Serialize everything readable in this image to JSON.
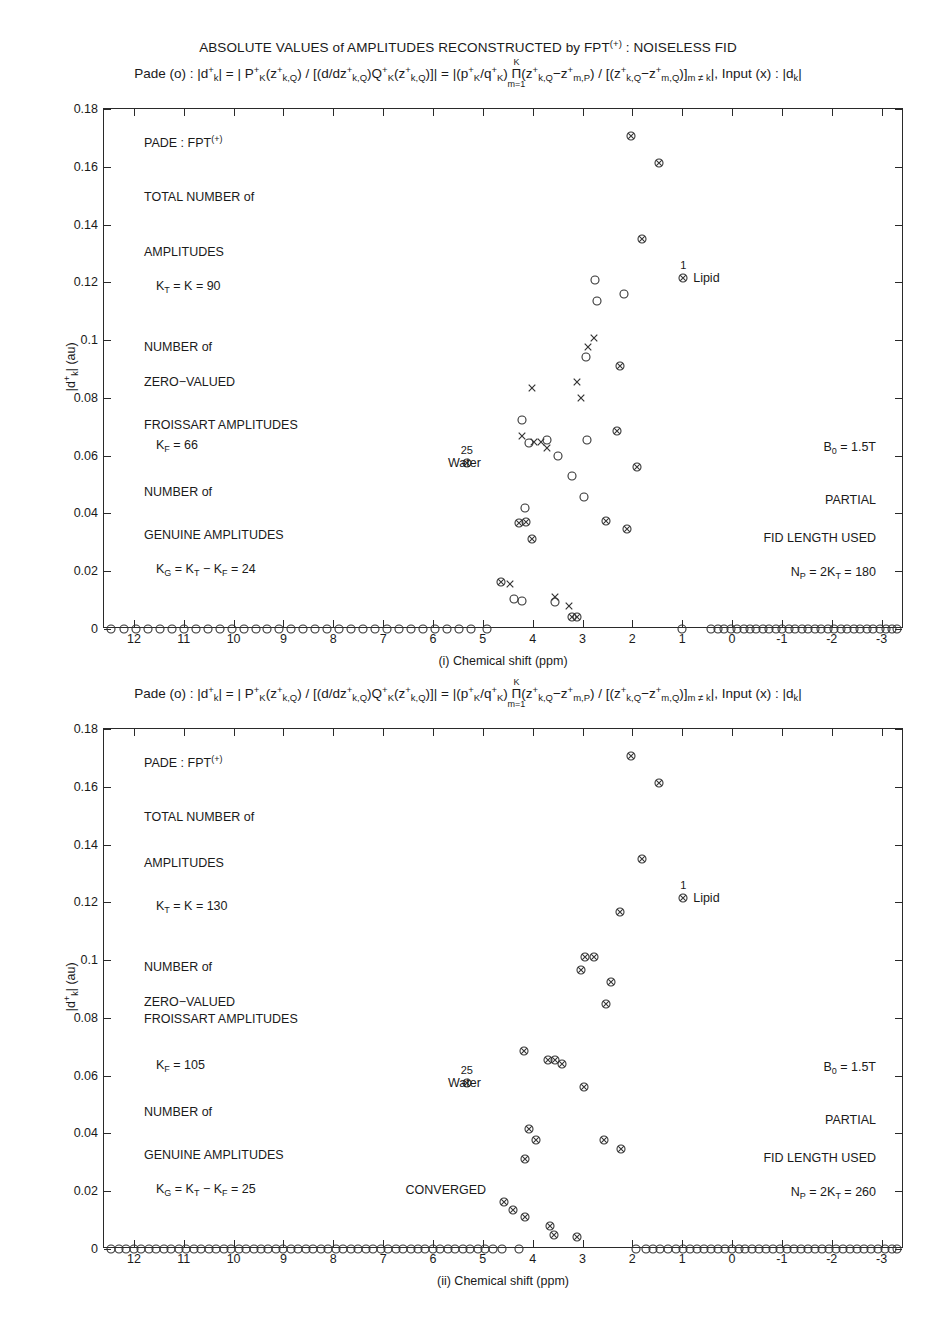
{
  "figure": {
    "suptitle_pre": "ABSOLUTE VALUES of AMPLITUDES RECONSTRUCTED by FPT",
    "suptitle_sup": "(+)",
    "suptitle_post": " :  NOISELESS FID",
    "width": 936,
    "height": 1331
  },
  "formula": {
    "pade_prefix": "Pade (o) : ",
    "lhs": "|d",
    "lhs_sub": "k",
    "lhs_sup": "+",
    "lhs_close": "| = | P",
    "p_sub": "K",
    "p_sup": "+",
    "z1": "(z",
    "z1_sup": "+",
    "z1_sub": "k,Q",
    "z1_close": ") / [(d/dz",
    "dz_sup": "+",
    "dz_sub": "k,Q",
    "q_open": ")Q",
    "q_sub": "K",
    "q_sup": "+",
    "q_z": "(z",
    "q_z_sup": "+",
    "q_z_sub": "k,Q",
    "q_close": ")]| = |(p",
    "p2_sub": "K",
    "p2_sup": "+",
    "slash_q": "/q",
    "q2_sub": "K",
    "q2_sup": "+",
    "paren": ") ",
    "pi_sym": "Π",
    "pi_top": "K",
    "pi_bot": "m=1",
    "prod1_open": "(z",
    "prod1_sup": "+",
    "prod1_sub": "k,Q",
    "minus": "−z",
    "prod2_sup": "+",
    "prod2_sub_a": "m,P",
    "prod2_sub_b": "m,Q",
    "mid": ") / [(z",
    "mid_sup": "+",
    "mid_sub": "k,Q",
    "tail_close": ")]",
    "tail_sub": "m ≠ k",
    "tail_abs": "|",
    "input_text": ",  Input (x) : |d",
    "input_sub": "k",
    "input_close": "|"
  },
  "axes": {
    "y_ticks": [
      "0.18",
      "0.16",
      "0.14",
      "0.12",
      "0.1",
      "0.08",
      "0.06",
      "0.04",
      "0.02",
      "0"
    ],
    "y_values": [
      0.18,
      0.16,
      0.14,
      0.12,
      0.1,
      0.08,
      0.06,
      0.04,
      0.02,
      0
    ],
    "y_min": 0,
    "y_max": 0.18,
    "y_title_a": "|d",
    "y_title_sub": "k",
    "y_title_sup": "+",
    "y_title_b": "| (au)",
    "x_ticks": [
      "12",
      "11",
      "10",
      "9",
      "8",
      "7",
      "6",
      "5",
      "4",
      "3",
      "2",
      "1",
      "0",
      "-1",
      "-2",
      "-3"
    ],
    "x_values": [
      12,
      11,
      10,
      9,
      8,
      7,
      6,
      5,
      4,
      3,
      2,
      1,
      0,
      -1,
      -2,
      -3
    ],
    "x_min": -3.45,
    "x_max": 12.6,
    "x_title_top": "(i) Chemical shift (ppm)",
    "x_title_bottom": "(ii) Chemical shift (ppm)"
  },
  "panel1": {
    "notes_left": [
      {
        "text": "PADE : FPT",
        "sup": "(+)",
        "y": 0.1685
      },
      {
        "text": "TOTAL NUMBER of",
        "y": 0.1495
      },
      {
        "text": "AMPLITUDES",
        "y": 0.1305
      },
      {
        "text": "K_T = K = 90",
        "y": 0.1185,
        "indent": true
      },
      {
        "text": "NUMBER of",
        "y": 0.0975
      },
      {
        "text": "ZERO−VALUED",
        "y": 0.0855
      },
      {
        "text": "FROISSART AMPLITUDES",
        "y": 0.0705
      },
      {
        "text": "K_F = 66",
        "y": 0.0635,
        "indent": true
      },
      {
        "text": "NUMBER of",
        "y": 0.0475
      },
      {
        "text": "GENUINE AMPLITUDES",
        "y": 0.0325
      },
      {
        "text": "K_G = K_T − K_F = 24",
        "y": 0.0205,
        "indent": true
      }
    ],
    "notes_right": [
      {
        "text": "B_0 = 1.5T",
        "y": 0.0625
      },
      {
        "text": "PARTIAL",
        "y": 0.0445
      },
      {
        "text": "FID LENGTH USED",
        "y": 0.0315
      },
      {
        "text": "N_P = 2K_T = 180",
        "y": 0.0195
      }
    ],
    "label_water": {
      "text": "Water",
      "x": 5.32,
      "y": 0.0575,
      "count": "25"
    },
    "label_lipid": {
      "text": "Lipid",
      "x": 0.98,
      "y": 0.1215,
      "count": "1"
    },
    "markers_circle": [
      {
        "x": 4.22,
        "y": 0.0725
      },
      {
        "x": 4.07,
        "y": 0.0645
      },
      {
        "x": 3.72,
        "y": 0.0655
      },
      {
        "x": 3.49,
        "y": 0.0598
      },
      {
        "x": 3.22,
        "y": 0.053
      },
      {
        "x": 2.93,
        "y": 0.094
      },
      {
        "x": 2.75,
        "y": 0.1207
      },
      {
        "x": 2.7,
        "y": 0.1137
      },
      {
        "x": 2.16,
        "y": 0.1158
      },
      {
        "x": 2.97,
        "y": 0.0458
      },
      {
        "x": 4.38,
        "y": 0.0103
      },
      {
        "x": 4.21,
        "y": 0.0098
      },
      {
        "x": 3.55,
        "y": 0.0093
      },
      {
        "x": 4.16,
        "y": 0.0418
      },
      {
        "x": 2.9,
        "y": 0.0655
      }
    ],
    "markers_x": [
      {
        "x": 4.21,
        "y": 0.0668
      },
      {
        "x": 3.98,
        "y": 0.0648
      },
      {
        "x": 3.84,
        "y": 0.0648
      },
      {
        "x": 3.71,
        "y": 0.0628
      },
      {
        "x": 3.04,
        "y": 0.08
      },
      {
        "x": 2.88,
        "y": 0.0975
      },
      {
        "x": 2.77,
        "y": 0.1008
      },
      {
        "x": 3.12,
        "y": 0.0855
      },
      {
        "x": 4.45,
        "y": 0.0155
      },
      {
        "x": 3.56,
        "y": 0.0112
      },
      {
        "x": 3.27,
        "y": 0.0078
      },
      {
        "x": 4.02,
        "y": 0.0835
      }
    ],
    "markers_both": [
      {
        "x": 2.02,
        "y": 0.1708
      },
      {
        "x": 1.46,
        "y": 0.1612
      },
      {
        "x": 1.8,
        "y": 0.135
      },
      {
        "x": 0.98,
        "y": 0.1215
      },
      {
        "x": 2.25,
        "y": 0.0912
      },
      {
        "x": 5.32,
        "y": 0.0575
      },
      {
        "x": 2.31,
        "y": 0.0685
      },
      {
        "x": 1.9,
        "y": 0.0562
      },
      {
        "x": 4.13,
        "y": 0.037
      },
      {
        "x": 4.02,
        "y": 0.0312
      },
      {
        "x": 2.52,
        "y": 0.0375
      },
      {
        "x": 2.1,
        "y": 0.0345
      },
      {
        "x": 4.63,
        "y": 0.0163
      },
      {
        "x": 3.22,
        "y": 0.0042
      },
      {
        "x": 4.27,
        "y": 0.0368
      }
    ],
    "zero_line_x_left": [
      12.45,
      12.2,
      11.96,
      11.72,
      11.48,
      11.24,
      11.0,
      10.76,
      10.52,
      10.28,
      10.04,
      9.8,
      9.56,
      9.32,
      9.08,
      8.84,
      8.6,
      8.36,
      8.12,
      7.88,
      7.64,
      7.4,
      7.16,
      6.92,
      6.68,
      6.44,
      6.2,
      5.96,
      5.72,
      5.48,
      5.24,
      4.92
    ],
    "zero_line_x_right": [
      1.0,
      0.42,
      0.16,
      -0.1,
      -0.36,
      -0.62,
      -0.88,
      -1.14,
      -1.4,
      -1.66,
      -1.92,
      -2.18,
      -2.44,
      -2.7,
      -2.96,
      -3.2,
      -0.23,
      -0.49,
      -0.75,
      -1.01,
      -1.27,
      -1.53,
      -1.79,
      -2.05,
      -2.31,
      -2.57,
      -2.83,
      -3.08,
      0.29,
      0.03,
      -3.3
    ],
    "zero_line_marker_mid": {
      "x": 3.12,
      "y": 0.0042
    }
  },
  "panel2": {
    "notes_left": [
      {
        "text": "PADE : FPT",
        "sup": "(+)",
        "y": 0.1685
      },
      {
        "text": "TOTAL NUMBER of",
        "y": 0.1495
      },
      {
        "text": "AMPLITUDES",
        "y": 0.1335
      },
      {
        "text": "K_T = K = 130",
        "y": 0.1185,
        "indent": true
      },
      {
        "text": "NUMBER of",
        "y": 0.0975
      },
      {
        "text": "ZERO−VALUED",
        "y": 0.0855
      },
      {
        "text": "FROISSART AMPLITUDES",
        "y": 0.0795
      },
      {
        "text": "K_F = 105",
        "y": 0.0635,
        "indent": true
      },
      {
        "text": "NUMBER of",
        "y": 0.0475
      },
      {
        "text": "GENUINE AMPLITUDES",
        "y": 0.0325
      },
      {
        "text": "K_G = K_T − K_F = 25",
        "y": 0.0205,
        "indent": true
      }
    ],
    "notes_right": [
      {
        "text": "B_0 = 1.5T",
        "y": 0.0625
      },
      {
        "text": "PARTIAL",
        "y": 0.0445
      },
      {
        "text": "FID LENGTH USED",
        "y": 0.0315
      },
      {
        "text": "N_P = 2K_T = 260",
        "y": 0.0195
      }
    ],
    "note_converged": {
      "text": "CONVERGED",
      "x": 6.55,
      "y": 0.0205
    },
    "label_water": {
      "text": "Water",
      "x": 5.32,
      "y": 0.0575,
      "count": "25"
    },
    "label_lipid": {
      "text": "Lipid",
      "x": 0.98,
      "y": 0.1215,
      "count": "1"
    },
    "markers_both": [
      {
        "x": 2.02,
        "y": 0.1708
      },
      {
        "x": 1.46,
        "y": 0.1612
      },
      {
        "x": 1.8,
        "y": 0.135
      },
      {
        "x": 0.98,
        "y": 0.1215
      },
      {
        "x": 2.25,
        "y": 0.1165
      },
      {
        "x": 2.95,
        "y": 0.101
      },
      {
        "x": 2.77,
        "y": 0.101
      },
      {
        "x": 3.04,
        "y": 0.0965
      },
      {
        "x": 2.42,
        "y": 0.0925
      },
      {
        "x": 2.53,
        "y": 0.0848
      },
      {
        "x": 4.18,
        "y": 0.0685
      },
      {
        "x": 3.7,
        "y": 0.0655
      },
      {
        "x": 3.56,
        "y": 0.0655
      },
      {
        "x": 3.42,
        "y": 0.064
      },
      {
        "x": 5.32,
        "y": 0.0575
      },
      {
        "x": 2.98,
        "y": 0.056
      },
      {
        "x": 4.07,
        "y": 0.0415
      },
      {
        "x": 3.94,
        "y": 0.0378
      },
      {
        "x": 4.16,
        "y": 0.0312
      },
      {
        "x": 2.57,
        "y": 0.0378
      },
      {
        "x": 2.22,
        "y": 0.0345
      },
      {
        "x": 4.58,
        "y": 0.0162
      },
      {
        "x": 4.4,
        "y": 0.0135
      },
      {
        "x": 4.16,
        "y": 0.011
      },
      {
        "x": 3.65,
        "y": 0.008
      },
      {
        "x": 3.58,
        "y": 0.0048
      },
      {
        "x": 3.12,
        "y": 0.0042
      }
    ],
    "zero_line_x_left": [
      12.45,
      12.3,
      12.15,
      12.0,
      11.85,
      11.7,
      11.55,
      11.4,
      11.25,
      11.1,
      10.95,
      10.8,
      10.65,
      10.5,
      10.35,
      10.2,
      10.05,
      9.9,
      9.75,
      9.6,
      9.45,
      9.3,
      9.15,
      9.0,
      8.85,
      8.7,
      8.55,
      8.4,
      8.25,
      8.1,
      7.95,
      7.8,
      7.65,
      7.5,
      7.35,
      7.2,
      7.05,
      6.9,
      6.75,
      6.6,
      6.45,
      6.3,
      6.15,
      6.0,
      5.85,
      5.7,
      5.55,
      5.4,
      5.25,
      5.1,
      4.95,
      4.8,
      4.62,
      4.28
    ],
    "zero_line_x_right": [
      1.92,
      1.72,
      1.58,
      1.44,
      1.28,
      1.13,
      0.99,
      0.85,
      0.71,
      0.57,
      0.43,
      0.29,
      0.15,
      0.01,
      -0.13,
      -0.27,
      -0.41,
      -0.55,
      -0.69,
      -0.83,
      -0.97,
      -1.11,
      -1.25,
      -1.39,
      -1.53,
      -1.67,
      -1.81,
      -1.95,
      -2.09,
      -2.23,
      -2.37,
      -2.51,
      -2.65,
      -2.79,
      -2.93,
      -3.07,
      -3.2,
      -3.3
    ]
  },
  "marker_styles": {
    "circle": "open-circle-marker",
    "x": "x-cross-marker",
    "both": "circle-x-marker"
  },
  "colors": {
    "axis": "#2a2a2a",
    "text": "#1a1a1a",
    "marker": "#333333"
  }
}
